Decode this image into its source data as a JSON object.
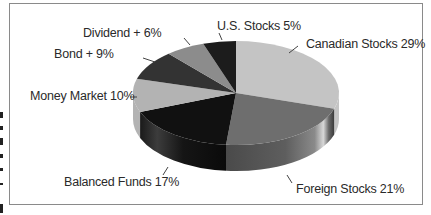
{
  "chart_data": {
    "type": "pie",
    "style": "3d-exploded-none",
    "title": "",
    "slices": [
      {
        "label": "Canadian Stocks",
        "value": 29,
        "display": "Canadian Stocks 29%",
        "color": "#c4c4c4"
      },
      {
        "label": "Foreign Stocks",
        "value": 21,
        "display": "Foreign Stocks 21%",
        "color": "#6e6e6e"
      },
      {
        "label": "Balanced Funds",
        "value": 17,
        "display": "Balanced Funds 17%",
        "color": "#111111"
      },
      {
        "label": "Money Market",
        "value": 10,
        "display": "Money Market 10%",
        "color": "#b3b3b3"
      },
      {
        "label": "Bond +",
        "value": 9,
        "display": "Bond + 9%",
        "color": "#333333"
      },
      {
        "label": "Dividend +",
        "value": 6,
        "display": "Dividend + 6%",
        "color": "#8c8c8c"
      },
      {
        "label": "U.S. Stocks",
        "value": 5,
        "display": "U.S. Stocks 5%",
        "color": "#1c1c1c"
      }
    ],
    "legend": "none (callout labels)",
    "grid": false
  }
}
